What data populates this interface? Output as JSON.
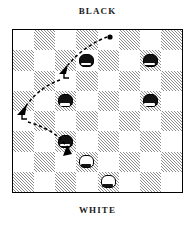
{
  "diagram": {
    "kind": "checkers-board-diagram",
    "top_label": "BLACK",
    "bottom_label": "WHITE",
    "board": {
      "columns": 8,
      "rows": 8,
      "light_color": "#ffffff",
      "dark_color": "#8e8e8e",
      "dark_fill_style": "diagonal-hatch",
      "border_color": "#000000",
      "top_left_square": "light"
    },
    "pieces": [
      {
        "id": "black-1",
        "color": "black",
        "col": 3,
        "row": 1
      },
      {
        "id": "black-2",
        "color": "black",
        "col": 6,
        "row": 1
      },
      {
        "id": "black-3",
        "color": "black",
        "col": 2,
        "row": 3
      },
      {
        "id": "black-4",
        "color": "black",
        "col": 6,
        "row": 3
      },
      {
        "id": "black-5",
        "color": "black",
        "col": 2,
        "row": 5
      },
      {
        "id": "white-1",
        "color": "white",
        "col": 3,
        "row": 6
      },
      {
        "id": "white-2",
        "color": "white",
        "col": 4,
        "row": 7
      }
    ],
    "move_path": {
      "style": "dashed",
      "color": "#000000",
      "start_marker": "dot",
      "start_point": {
        "x": 110,
        "y": 37
      },
      "end_point": {
        "x": 68,
        "y": 156
      },
      "arrowheads": [
        {
          "x": 62,
          "y": 72,
          "direction": "down-left"
        },
        {
          "x": 21,
          "y": 113,
          "direction": "down-left"
        },
        {
          "x": 68,
          "y": 153,
          "direction": "down"
        }
      ],
      "step_markers": [
        {
          "x": 64,
          "y": 78
        },
        {
          "x": 22,
          "y": 119
        }
      ]
    },
    "colors": {
      "ink": "#000000",
      "black_piece": "#111111",
      "white_piece": "#ffffff",
      "hatch": "#8e8e8e",
      "page_background": "#ffffff"
    }
  }
}
